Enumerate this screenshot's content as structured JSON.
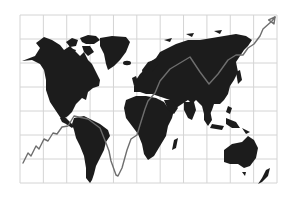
{
  "grid": {
    "columns": 11,
    "rows": 7,
    "x_start": 20,
    "x_end": 277,
    "y_start": 15,
    "y_end": 183,
    "line_color": "#d4d4d4"
  },
  "colors": {
    "background": "#ffffff",
    "land": "#1c1c1c",
    "trend_line": "#6e6e6e",
    "trend_line_on_white": "#555555"
  },
  "trend_line": {
    "points": [
      [
        23,
        163
      ],
      [
        28,
        153
      ],
      [
        31,
        156
      ],
      [
        36,
        146
      ],
      [
        39,
        149
      ],
      [
        44,
        139
      ],
      [
        48,
        141
      ],
      [
        53,
        133
      ],
      [
        57,
        134
      ],
      [
        62,
        127
      ],
      [
        68,
        126
      ],
      [
        74,
        116
      ],
      [
        88,
        119
      ],
      [
        100,
        128
      ],
      [
        106,
        143
      ],
      [
        109,
        151
      ],
      [
        111,
        161
      ],
      [
        116,
        175
      ],
      [
        118,
        176
      ],
      [
        122,
        168
      ],
      [
        127,
        150
      ],
      [
        131,
        139
      ],
      [
        137,
        135
      ],
      [
        140,
        125
      ],
      [
        145,
        109
      ],
      [
        148,
        101
      ],
      [
        155,
        93
      ],
      [
        160,
        81
      ],
      [
        170,
        69
      ],
      [
        180,
        63
      ],
      [
        190,
        57
      ],
      [
        200,
        72
      ],
      [
        209,
        84
      ],
      [
        218,
        74
      ],
      [
        228,
        60
      ],
      [
        236,
        55
      ],
      [
        243,
        55
      ],
      [
        248,
        48
      ],
      [
        254,
        44
      ],
      [
        260,
        36
      ],
      [
        263,
        29
      ],
      [
        272,
        21
      ]
    ],
    "arrow_tip": [
      275,
      17
    ]
  }
}
